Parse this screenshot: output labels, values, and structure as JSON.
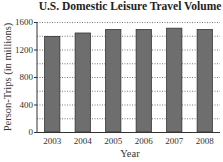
{
  "chart_data": {
    "type": "bar",
    "title": "U.S. Domestic Leisure Travel Volume",
    "xlabel": "Year",
    "ylabel": "Person-Trips (in millions)",
    "categories": [
      "2003",
      "2004",
      "2005",
      "2006",
      "2007",
      "2008"
    ],
    "values": [
      1390,
      1440,
      1490,
      1490,
      1510,
      1490
    ],
    "ylim": [
      0,
      1600
    ],
    "yticks": [
      0,
      400,
      800,
      1200,
      1600
    ],
    "ytick_labels": [
      "0",
      "400",
      "800",
      "1200",
      "1600"
    ],
    "grid": true,
    "grid_step": 200,
    "bar_color": "#6e6e6e",
    "bar_edge_color": "#333333",
    "legend": "none"
  }
}
